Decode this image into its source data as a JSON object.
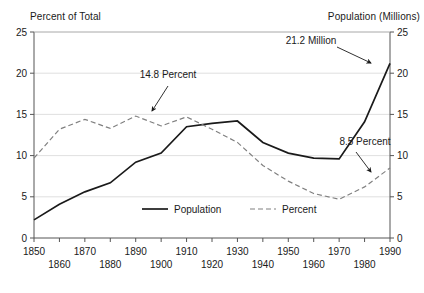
{
  "chart_data": {
    "type": "line",
    "title": "",
    "left_axis_title": "Percent of Total",
    "right_axis_title": "Population (Millions)",
    "xlabel": "",
    "x": [
      1850,
      1860,
      1870,
      1880,
      1890,
      1900,
      1910,
      1920,
      1930,
      1940,
      1950,
      1960,
      1970,
      1980,
      1990
    ],
    "x_tick_labels": [
      "1850",
      "1860",
      "1870",
      "1880",
      "1890",
      "1900",
      "1910",
      "1920",
      "1930",
      "1940",
      "1950",
      "1960",
      "1970",
      "1980",
      "1990"
    ],
    "y_tick_labels": [
      "0",
      "5",
      "10",
      "15",
      "20",
      "25"
    ],
    "y_ticks": [
      0,
      5,
      10,
      15,
      20,
      25
    ],
    "ylim": [
      0,
      25
    ],
    "y2_tick_labels": [
      "0",
      "5",
      "10",
      "15",
      "20",
      "25"
    ],
    "y2_ticks": [
      0,
      5,
      10,
      15,
      20,
      25
    ],
    "y2lim": [
      0,
      25
    ],
    "grid": true,
    "legend_position": "inside-bottom-center",
    "series": [
      {
        "name": "Population",
        "style": "solid",
        "axis": "right",
        "color": "#1a1a1a",
        "values": [
          2.2,
          4.1,
          5.6,
          6.7,
          9.2,
          10.3,
          13.5,
          13.9,
          14.2,
          11.6,
          10.3,
          9.7,
          9.6,
          14.1,
          21.2
        ]
      },
      {
        "name": "Percent",
        "style": "dashed",
        "axis": "left",
        "color": "#808080",
        "values": [
          9.7,
          13.2,
          14.4,
          13.3,
          14.8,
          13.6,
          14.7,
          13.2,
          11.6,
          8.8,
          6.9,
          5.4,
          4.7,
          6.2,
          8.5
        ]
      }
    ],
    "annotations": [
      {
        "text": "14.8 Percent",
        "label_x": 168,
        "label_y": 78,
        "arrow_from_x": 168,
        "arrow_from_y": 86,
        "arrow_to_x": 152,
        "arrow_to_y": 111
      },
      {
        "text": "21.2 Million",
        "label_x": 311,
        "label_y": 44,
        "arrow_from_x": 337,
        "arrow_from_y": 47,
        "arrow_to_x": 371,
        "arrow_to_y": 63
      },
      {
        "text": "8.5 Percent",
        "label_x": 365,
        "label_y": 145,
        "arrow_from_x": 356,
        "arrow_from_y": 152,
        "arrow_to_x": 371,
        "arrow_to_y": 172
      }
    ],
    "legend_entries": [
      {
        "name": "Population",
        "style": "solid"
      },
      {
        "name": "Percent",
        "style": "dashed"
      }
    ]
  }
}
